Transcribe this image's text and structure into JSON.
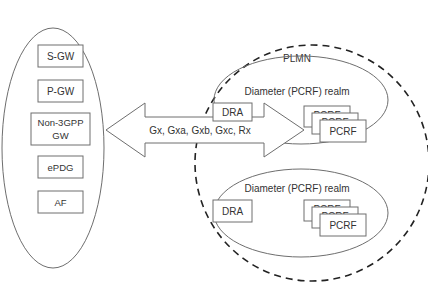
{
  "diagram": {
    "colors": {
      "stroke": "#6e6e6e",
      "dashed_stroke": "#222222",
      "text": "#333333",
      "background": "#ffffff"
    },
    "left_group": {
      "nodes": [
        {
          "id": "sgw",
          "label": "S-GW"
        },
        {
          "id": "pgw",
          "label": "P-GW"
        },
        {
          "id": "non3gpp",
          "label_line1": "Non-3GPP",
          "label_line2": "GW"
        },
        {
          "id": "epdg",
          "label": "ePDG"
        },
        {
          "id": "af",
          "label": "AF"
        }
      ]
    },
    "interface_arrow": {
      "label": "Gx, Gxa, Gxb, Gxc, Rx",
      "direction": "bidirectional"
    },
    "plmn": {
      "label": "PLMN",
      "realms": [
        {
          "label": "Diameter (PCRF) realm",
          "dra_label": "DRA",
          "pcrf_labels": [
            "PCRF",
            "PCRF",
            "PCRF"
          ]
        },
        {
          "label": "Diameter (PCRF) realm",
          "dra_label": "DRA",
          "pcrf_labels": [
            "PCRF",
            "PCRF",
            "PCRF"
          ]
        }
      ]
    }
  }
}
